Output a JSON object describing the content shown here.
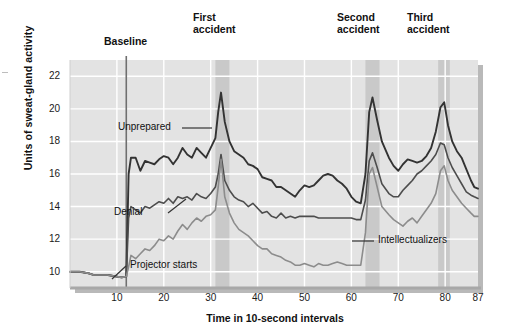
{
  "chart_data": {
    "type": "line",
    "title": "",
    "xlabel": "Time in 10-second intervals",
    "ylabel": "Units of sweat-gland activity",
    "xlim": [
      0,
      87
    ],
    "ylim": [
      9,
      23
    ],
    "xticks": [
      10,
      20,
      30,
      40,
      50,
      60,
      70,
      80,
      87
    ],
    "yticks": [
      10,
      12,
      14,
      16,
      18,
      20,
      22
    ],
    "grid": true,
    "legend": "inline-labels",
    "annotations": [
      {
        "name": "baseline",
        "label": "Baseline",
        "x": 12,
        "type": "vertical-line"
      },
      {
        "name": "first-accident",
        "label": "First\naccident",
        "x_start": 31,
        "x_end": 34,
        "type": "band"
      },
      {
        "name": "second-accident",
        "label": "Second\naccident",
        "x_start": 63,
        "x_end": 66,
        "type": "band"
      },
      {
        "name": "third-accident",
        "label": "Third\naccident",
        "x_start": 78.5,
        "x_end": 81,
        "type": "band"
      },
      {
        "name": "projector-starts",
        "label": "Projector starts",
        "x": 12,
        "type": "callout"
      }
    ],
    "series": [
      {
        "name": "Unprepared",
        "color": "#333333",
        "x": [
          0,
          1,
          2,
          3,
          4,
          5,
          6,
          7,
          8,
          9,
          10,
          11,
          12,
          12.5,
          13,
          14,
          15,
          16,
          17,
          18,
          19,
          20,
          21,
          22,
          23,
          24,
          25,
          26,
          27,
          28,
          29,
          30,
          31,
          31.6,
          32.2,
          33,
          34,
          35,
          36,
          37,
          38,
          39,
          40,
          41,
          42,
          43,
          44,
          45,
          46,
          47,
          48,
          49,
          50,
          51,
          52,
          53,
          54,
          55,
          56,
          57,
          58,
          59,
          60,
          61,
          62,
          63,
          63.8,
          64.5,
          65.5,
          66.5,
          68,
          69,
          70,
          71,
          72,
          73,
          74,
          75,
          76,
          77,
          78,
          79,
          79.8,
          80.6,
          81.5,
          82.5,
          83.5,
          84.5,
          85.5,
          86.2,
          87
        ],
        "y": [
          10.0,
          10.0,
          10.0,
          9.95,
          9.9,
          9.8,
          9.8,
          9.8,
          9.8,
          9.75,
          9.7,
          9.65,
          9.7,
          16.0,
          17.0,
          17.0,
          16.2,
          16.8,
          16.7,
          16.6,
          16.9,
          17.1,
          17.0,
          16.6,
          17.0,
          17.6,
          17.2,
          17.0,
          17.6,
          17.3,
          17.0,
          17.6,
          18.2,
          19.8,
          21.0,
          19.2,
          18.0,
          17.4,
          17.2,
          17.0,
          16.6,
          16.5,
          16.3,
          15.8,
          15.7,
          15.6,
          15.2,
          15.2,
          15.0,
          14.8,
          14.6,
          15.0,
          15.3,
          15.2,
          15.3,
          15.6,
          15.9,
          16.0,
          15.9,
          15.6,
          15.4,
          15.1,
          14.6,
          14.3,
          14.2,
          16.0,
          19.8,
          20.7,
          19.3,
          18.0,
          17.0,
          16.5,
          16.2,
          16.6,
          16.9,
          16.8,
          16.7,
          16.8,
          17.1,
          17.6,
          18.6,
          20.1,
          20.4,
          19.0,
          18.0,
          17.4,
          17.0,
          16.3,
          15.6,
          15.2,
          15.1
        ]
      },
      {
        "name": "Denial",
        "color": "#4d4d4d",
        "x": [
          0,
          1,
          2,
          3,
          4,
          5,
          6,
          7,
          8,
          9,
          10,
          11,
          12,
          12.5,
          13,
          14,
          15,
          16,
          17,
          18,
          19,
          20,
          21,
          22,
          23,
          24,
          25,
          26,
          27,
          28,
          29,
          30,
          31,
          31.6,
          32.2,
          33,
          34,
          35,
          36,
          37,
          38,
          39,
          40,
          41,
          42,
          43,
          44,
          45,
          46,
          47,
          48,
          49,
          50,
          51,
          52,
          53,
          54,
          55,
          56,
          57,
          58,
          59,
          60,
          61,
          62,
          63,
          63.8,
          64.5,
          65.5,
          66.5,
          68,
          69,
          70,
          71,
          72,
          73,
          74,
          75,
          76,
          77,
          78,
          79,
          79.8,
          80.6,
          81.5,
          82.5,
          83.5,
          84.5,
          85.5,
          86.2,
          87
        ],
        "y": [
          10.0,
          10.0,
          10.0,
          9.95,
          9.9,
          9.8,
          9.8,
          9.8,
          9.8,
          9.75,
          9.7,
          9.65,
          9.7,
          13.3,
          14.0,
          13.8,
          13.6,
          14.0,
          13.9,
          14.1,
          14.3,
          14.2,
          14.5,
          14.2,
          14.6,
          14.5,
          14.6,
          14.4,
          14.8,
          14.6,
          14.5,
          14.8,
          15.2,
          16.0,
          17.2,
          15.6,
          15.0,
          14.6,
          14.4,
          14.3,
          14.0,
          14.2,
          13.9,
          13.6,
          13.7,
          13.4,
          13.3,
          13.6,
          13.3,
          13.4,
          13.3,
          13.4,
          13.4,
          13.4,
          13.4,
          13.3,
          13.3,
          13.3,
          13.3,
          13.3,
          13.3,
          13.3,
          13.3,
          13.2,
          13.2,
          14.4,
          16.8,
          17.3,
          16.4,
          15.4,
          14.8,
          14.6,
          14.6,
          15.0,
          15.3,
          15.6,
          16.0,
          16.2,
          16.5,
          16.8,
          17.2,
          17.9,
          17.8,
          17.0,
          16.4,
          15.9,
          15.4,
          14.9,
          14.7,
          14.6,
          14.5
        ]
      },
      {
        "name": "Intellectualizers",
        "color": "#8c8c8c",
        "x": [
          0,
          1,
          2,
          3,
          4,
          5,
          6,
          7,
          8,
          9,
          10,
          11,
          12,
          12.5,
          13,
          14,
          15,
          16,
          17,
          18,
          19,
          20,
          21,
          22,
          23,
          24,
          25,
          26,
          27,
          28,
          29,
          30,
          31,
          31.6,
          32.2,
          33,
          34,
          35,
          36,
          37,
          38,
          39,
          40,
          41,
          42,
          43,
          44,
          45,
          46,
          47,
          48,
          49,
          50,
          51,
          52,
          53,
          54,
          55,
          56,
          57,
          58,
          59,
          60,
          61,
          62,
          63,
          63.8,
          64.5,
          65.5,
          66.5,
          68,
          69,
          70,
          71,
          72,
          73,
          74,
          75,
          76,
          77,
          78,
          79,
          79.8,
          80.6,
          81.5,
          82.5,
          83.5,
          84.5,
          85.5,
          86.2,
          87
        ],
        "y": [
          10.0,
          10.0,
          10.0,
          9.95,
          9.9,
          9.8,
          9.8,
          9.8,
          9.8,
          9.75,
          9.7,
          9.65,
          9.7,
          10.3,
          11.0,
          10.8,
          11.1,
          11.4,
          11.3,
          11.6,
          12.0,
          11.9,
          12.2,
          12.0,
          12.5,
          12.9,
          12.6,
          13.0,
          13.3,
          13.1,
          13.4,
          13.5,
          13.8,
          15.2,
          16.9,
          14.6,
          13.6,
          13.0,
          12.6,
          12.4,
          12.2,
          11.9,
          11.6,
          11.4,
          11.4,
          11.1,
          11.0,
          10.9,
          10.7,
          10.6,
          10.4,
          10.4,
          10.5,
          10.4,
          10.3,
          10.5,
          10.4,
          10.4,
          10.5,
          10.6,
          10.5,
          10.4,
          10.4,
          10.4,
          10.4,
          12.4,
          16.0,
          16.4,
          15.2,
          14.0,
          13.5,
          13.2,
          13.0,
          12.8,
          13.1,
          13.3,
          13.0,
          13.4,
          13.8,
          14.2,
          14.8,
          16.2,
          16.5,
          15.6,
          15.0,
          14.6,
          14.2,
          13.9,
          13.6,
          13.4,
          13.4
        ]
      }
    ]
  },
  "labels": {
    "baseline": "Baseline",
    "first_accident_l1": "First",
    "first_accident_l2": "accident",
    "second_accident_l1": "Second",
    "second_accident_l2": "accident",
    "third_accident_l1": "Third",
    "third_accident_l2": "accident",
    "unprepared": "Unprepared",
    "denial": "Denial",
    "intellectualizers": "Intellectualizers",
    "projector_starts": "Projector starts",
    "y_axis": "Units of sweat-gland activity",
    "x_axis": "Time in 10-second intervals"
  },
  "ticks": {
    "y": [
      "22",
      "20",
      "18",
      "16",
      "14",
      "12",
      "10"
    ],
    "x": [
      "10",
      "20",
      "30",
      "40",
      "50",
      "60",
      "70",
      "80",
      "87"
    ]
  },
  "colors": {
    "plot_bg": "#e3e3e3",
    "band": "#c9c9c9",
    "grid": "#ffffff",
    "unprepared": "#333333",
    "denial": "#4d4d4d",
    "intellectualizers": "#8c8c8c",
    "axis": "#9a9a9a"
  }
}
